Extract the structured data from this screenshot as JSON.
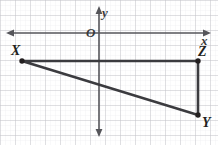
{
  "figure": {
    "type": "coordinate-plane-geometry-diagram",
    "width": 218,
    "height": 145,
    "background_color": "#ffffff",
    "grid": {
      "visible": true,
      "major_spacing_px": 15,
      "minor_per_major": 3,
      "major_color": "#c9c9ce",
      "minor_color": "#ededf0"
    },
    "axes": {
      "color": "#55555a",
      "stroke_width": 1.6,
      "x_axis": {
        "name": "x-axis",
        "label": "x",
        "y_px": 33,
        "arrow_start": true,
        "arrow_end": true
      },
      "y_axis": {
        "name": "y-axis",
        "label": "y",
        "x_px": 99,
        "arrow_start": true,
        "arrow_end": true
      },
      "origin_label": "O"
    },
    "shape": {
      "name": "triangle XYZ",
      "stroke_color": "#3b3b3f",
      "stroke_width": 2.6,
      "vertex_dot_color": "#231f20",
      "vertex_dot_radius": 2.6,
      "vertices": [
        {
          "label": "X",
          "x_px": 22,
          "y_px": 61
        },
        {
          "label": "Y",
          "x_px": 198,
          "y_px": 115
        },
        {
          "label": "Z",
          "x_px": 198,
          "y_px": 61
        }
      ],
      "edges": [
        {
          "from": "X",
          "to": "Z"
        },
        {
          "from": "X",
          "to": "Y"
        },
        {
          "from": "Y",
          "to": "Z"
        }
      ]
    },
    "labels": {
      "X": "X",
      "Y": "Y",
      "Z": "Z",
      "x": "x",
      "y": "y",
      "O": "O"
    }
  }
}
